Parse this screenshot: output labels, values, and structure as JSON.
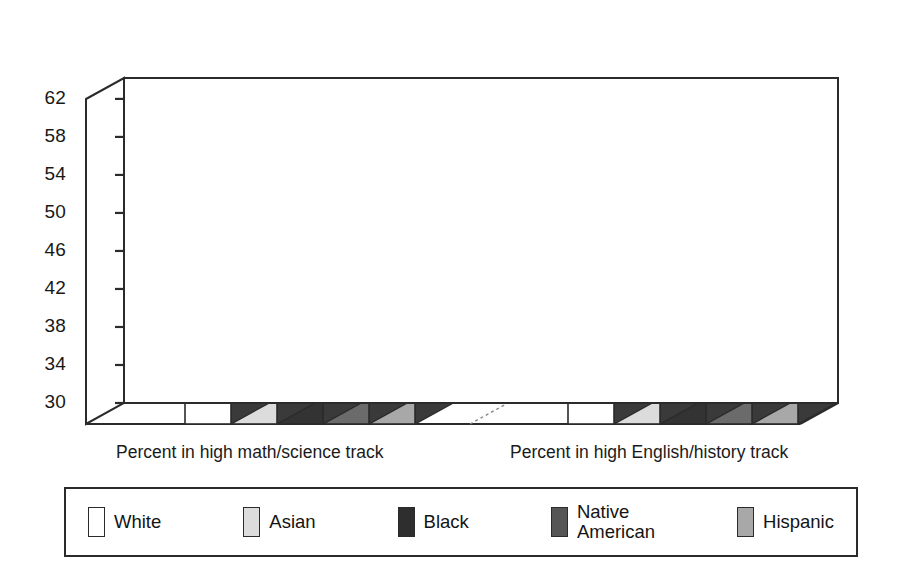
{
  "chart_data": {
    "type": "bar",
    "title": "",
    "subtitle": "",
    "xlabel": "",
    "ylabel": "",
    "ylim": [
      30,
      64
    ],
    "yticks": [
      30,
      34,
      38,
      42,
      46,
      50,
      54,
      58,
      62
    ],
    "grid": true,
    "three_d": true,
    "legend_position": "bottom",
    "categories": [
      "Percent in high math/science track",
      "Percent in high English/history track"
    ],
    "series": [
      {
        "name": "White",
        "values": [
          59.6,
          62.7
        ],
        "color": "#ffffff"
      },
      {
        "name": "Asian",
        "values": [
          56.5,
          55.5
        ],
        "color": "#dcdcdc"
      },
      {
        "name": "Black",
        "values": [
          46.1,
          53.5
        ],
        "color": "#333333"
      },
      {
        "name": "Native American",
        "values": [
          42.3,
          45.8
        ],
        "color": "#6b6b6b"
      },
      {
        "name": "Hispanic",
        "values": [
          41.3,
          45.8
        ],
        "color": "#a8a8a8"
      }
    ],
    "annotations": []
  },
  "axis": {
    "ticks": [
      "62",
      "58",
      "54",
      "50",
      "46",
      "42",
      "38",
      "34",
      "30"
    ]
  },
  "xlabels": [
    "Percent in high math/science track",
    "Percent in high English/history track"
  ],
  "legend": {
    "items": [
      {
        "label": "White",
        "color": "#ffffff"
      },
      {
        "label": "Asian",
        "color": "#dcdcdc"
      },
      {
        "label": "Black",
        "color": "#2e2e2e"
      },
      {
        "label": "Native\nAmerican",
        "color": "#555555"
      },
      {
        "label": "Hispanic",
        "color": "#a8a8a8"
      }
    ]
  },
  "colors": {
    "outline": "#2b2b2b",
    "side_shade": "#3a3a3a",
    "background": "#ffffff"
  }
}
